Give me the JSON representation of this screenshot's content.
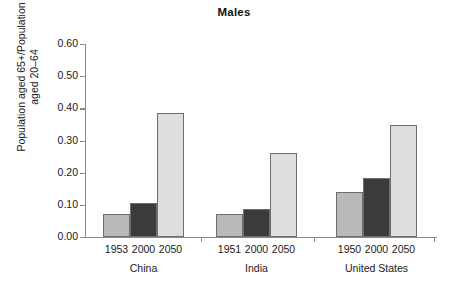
{
  "chart_data": {
    "type": "bar",
    "title": "Males",
    "xlabel": "",
    "ylabel": "Population aged 65+/Population aged 20–64",
    "ylabel_line1": "Population aged 65+/Population",
    "ylabel_line2": "aged 20–64",
    "ylim": [
      0.0,
      0.6
    ],
    "ytick_labels": [
      "0.00",
      "0.10",
      "0.20",
      "0.30",
      "0.40",
      "0.50",
      "0.60"
    ],
    "ytick_values": [
      0.0,
      0.1,
      0.2,
      0.3,
      0.4,
      0.5,
      0.6
    ],
    "grid": false,
    "legend": "none",
    "categories": [
      "China",
      "India",
      "United States"
    ],
    "groups": [
      {
        "name": "China",
        "bars": [
          {
            "year": "1953",
            "value": 0.072,
            "color": "#b9b9b9"
          },
          {
            "year": "2000",
            "value": 0.107,
            "color": "#3b3b3b"
          },
          {
            "year": "2050",
            "value": 0.385,
            "color": "#dedede"
          }
        ]
      },
      {
        "name": "India",
        "bars": [
          {
            "year": "1951",
            "value": 0.072,
            "color": "#b9b9b9"
          },
          {
            "year": "2000",
            "value": 0.086,
            "color": "#3b3b3b"
          },
          {
            "year": "2050",
            "value": 0.26,
            "color": "#dedede"
          }
        ]
      },
      {
        "name": "United States",
        "bars": [
          {
            "year": "1950",
            "value": 0.14,
            "color": "#b9b9b9"
          },
          {
            "year": "2000",
            "value": 0.182,
            "color": "#3b3b3b"
          },
          {
            "year": "2050",
            "value": 0.348,
            "color": "#dedede"
          }
        ]
      }
    ]
  }
}
